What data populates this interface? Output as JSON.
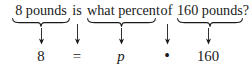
{
  "figure": {
    "type": "word-problem-translation",
    "colors": {
      "ink": "#1a1a1a",
      "background": "#ffffff"
    },
    "sentence": {
      "full_text": "8 pounds is what percent of 160 pounds?",
      "tokens": [
        {
          "id": "quantity",
          "text": "8 pounds",
          "kind": "phrase",
          "braced": true,
          "x": 13,
          "w": 56,
          "center": 41,
          "maps_to": "8"
        },
        {
          "id": "is",
          "text": "is",
          "kind": "link",
          "braced": false,
          "x": 70,
          "w": 14,
          "center": 77,
          "maps_to": "="
        },
        {
          "id": "percent",
          "text": "what percent",
          "kind": "phrase",
          "braced": true,
          "x": 87,
          "w": 69,
          "center": 121,
          "maps_to": "p"
        },
        {
          "id": "of",
          "text": "of",
          "kind": "link",
          "braced": false,
          "x": 159,
          "w": 15,
          "center": 167,
          "maps_to": "•"
        },
        {
          "id": "base",
          "text": "160 pounds?",
          "kind": "phrase",
          "braced": true,
          "x": 177,
          "w": 66,
          "center": 208,
          "maps_to": "160"
        }
      ]
    },
    "equation": {
      "full_text": "8 = p • 160",
      "tokens": [
        {
          "id": "eq-8",
          "text": "8",
          "kind": "num",
          "center": 41
        },
        {
          "id": "eq-eq",
          "text": "=",
          "kind": "op",
          "center": 77
        },
        {
          "id": "eq-p",
          "text": "p",
          "kind": "var",
          "center": 121
        },
        {
          "id": "eq-dot",
          "text": "•",
          "kind": "dot",
          "center": 167
        },
        {
          "id": "eq-160",
          "text": "160",
          "kind": "num",
          "center": 208
        }
      ]
    },
    "arrows": [
      {
        "id": "arrow-quantity",
        "center": 41,
        "from": "8 pounds",
        "to": "8"
      },
      {
        "id": "arrow-is",
        "center": 77,
        "from": "is",
        "to": "="
      },
      {
        "id": "arrow-percent",
        "center": 121,
        "from": "what percent",
        "to": "p"
      },
      {
        "id": "arrow-of",
        "center": 167,
        "from": "of",
        "to": "•"
      },
      {
        "id": "arrow-base",
        "center": 208,
        "from": "160 pounds?",
        "to": "160"
      }
    ]
  }
}
